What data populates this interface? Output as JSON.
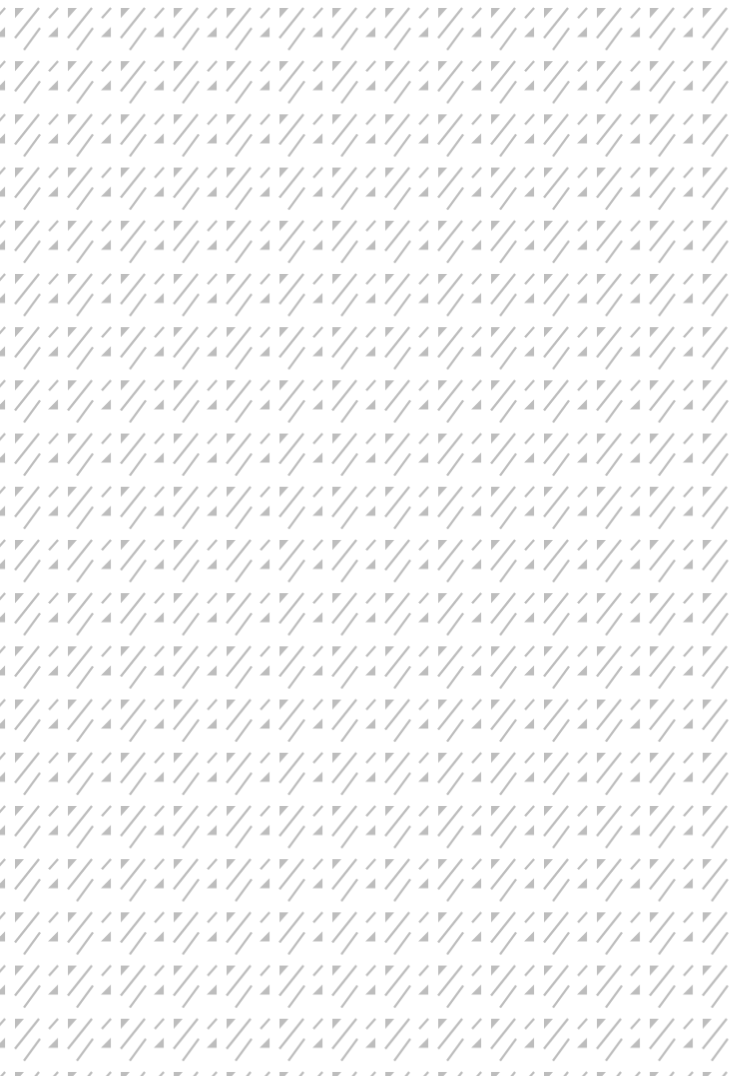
{
  "pattern": {
    "name": "diagonal-stripes-and-triangles",
    "background_color": "#ffffff",
    "foreground_color": "#bdbdbd",
    "columns": 14,
    "rows": 20,
    "tile_width": 52.9,
    "tile_height": 53.2,
    "offset_x": 12,
    "offset_y": 5,
    "tile_elements": [
      {
        "type": "triangle",
        "name": "top-left-triangle",
        "points": "3,3 12,3 3,13"
      },
      {
        "type": "line",
        "name": "long-diagonal-upper",
        "x1": 27,
        "y1": 3,
        "x2": 3,
        "y2": 33
      },
      {
        "type": "line",
        "name": "short-diagonal",
        "x1": 46,
        "y1": 3,
        "x2": 37,
        "y2": 13
      },
      {
        "type": "line",
        "name": "long-diagonal-lower",
        "x1": 28,
        "y1": 23,
        "x2": 12,
        "y2": 45
      },
      {
        "type": "triangle",
        "name": "bottom-right-triangle",
        "points": "46,22 46,32 36,32"
      }
    ],
    "stroke_width": 2.3
  }
}
